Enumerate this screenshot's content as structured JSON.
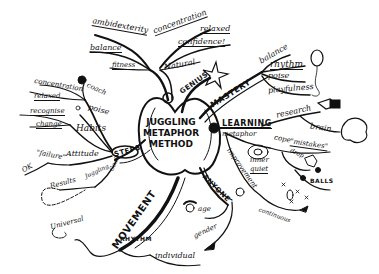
{
  "center": {
    "line1": "JUGGLING",
    "line2": "METAPHOR",
    "line3": "METHOD"
  },
  "branches": {
    "natural": {
      "label": "Natural",
      "children": [
        "fitness",
        "balance",
        "ambidexterity",
        "concentration",
        "relaxed",
        "confidence!"
      ]
    },
    "genius": {
      "label": "GENIUS"
    },
    "mastery": {
      "label": "MASTERY",
      "children": [
        "balance",
        "rhythm",
        "poise",
        "playfulness"
      ]
    },
    "learning": {
      "label": "LEARNING",
      "children": [
        "metaphor",
        "research",
        "brain",
        "cope",
        "\"mistakes\"",
        "drop",
        "BALLS",
        "inner",
        "quiet",
        "improvement",
        "continuous"
      ]
    },
    "anyone": {
      "label": "ANYONE",
      "children": [
        "age",
        "gender"
      ]
    },
    "movement": {
      "label": "MOVEMENT",
      "children": [
        "Universal",
        "RHYTHM",
        "individual"
      ]
    },
    "steps": {
      "label": "STEPS",
      "children": [
        "coach",
        "concentration",
        "relaxed",
        "poise",
        "recognise",
        "change",
        "Habits",
        "\"failure\"",
        "Attitude",
        "OK",
        "Goals",
        "Juggling",
        "Results"
      ]
    }
  }
}
